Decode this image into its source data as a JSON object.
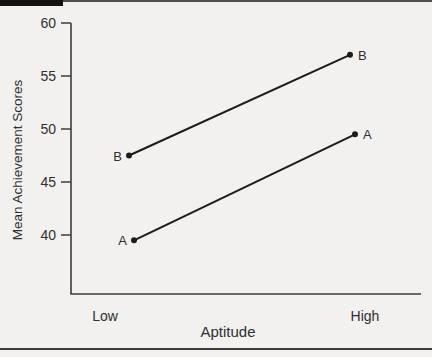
{
  "figure": {
    "background": "#f2f1ef",
    "top_bar_color": "#121212",
    "rule_color": "#4f4f4f"
  },
  "chart_data": {
    "type": "line",
    "title": "",
    "xlabel": "Aptitude",
    "ylabel": "Mean Achievement Scores",
    "categories": [
      "Low",
      "High"
    ],
    "series": [
      {
        "name": "A",
        "values": [
          39.5,
          49.5
        ]
      },
      {
        "name": "B",
        "values": [
          47.5,
          57
        ]
      }
    ],
    "yticks": [
      40,
      45,
      50,
      55,
      60
    ],
    "ylim": [
      34,
      60
    ],
    "grid": false,
    "legend_position": "endpoint-labels",
    "line_color": "#1c1c1c",
    "axis_color": "#3d3d3d",
    "text_color": "#2f2f2f",
    "marker": "filled-circle"
  }
}
